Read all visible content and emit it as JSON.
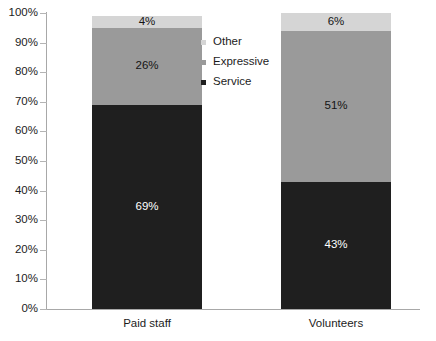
{
  "chart_data": {
    "type": "bar",
    "stacked": true,
    "orientation": "vertical",
    "title": "",
    "subtitle": "",
    "xlabel": "",
    "ylabel": "",
    "categories": [
      "Paid staff",
      "Volunteers"
    ],
    "series": [
      {
        "name": "Service",
        "color": "#1f1f1f",
        "values": [
          69,
          43
        ],
        "labels": [
          "69%",
          "43%"
        ],
        "label_color": "#ffffff"
      },
      {
        "name": "Expressive",
        "color": "#9a9a9a",
        "values": [
          26,
          51
        ],
        "labels": [
          "26%",
          "51%"
        ],
        "label_color": "#141414"
      },
      {
        "name": "Other",
        "color": "#d5d5d5",
        "values": [
          4,
          6
        ],
        "labels": [
          "4%",
          "6%"
        ],
        "label_color": "#141414"
      }
    ],
    "ylim": [
      0,
      100
    ],
    "yticks": [
      0,
      10,
      20,
      30,
      40,
      50,
      60,
      70,
      80,
      90,
      100
    ],
    "ytick_labels": [
      "0%",
      "10%",
      "20%",
      "30%",
      "40%",
      "50%",
      "60%",
      "70%",
      "80%",
      "90%",
      "100%"
    ],
    "grid": false,
    "legend": {
      "position": "inside-center",
      "entries": [
        {
          "label": "Other",
          "color": "#d5d5d5"
        },
        {
          "label": "Expressive",
          "color": "#9a9a9a"
        },
        {
          "label": "Service",
          "color": "#1f1f1f"
        }
      ]
    },
    "axis_color": "#a8a8a8",
    "background": "#ffffff"
  }
}
